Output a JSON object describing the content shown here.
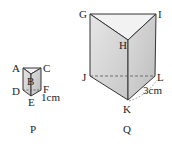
{
  "figure": {
    "prisms": [
      {
        "name": "P",
        "caption": "P",
        "vertices": {
          "A": "A",
          "B": "B",
          "C": "C",
          "D": "D",
          "E": "E",
          "F": "F"
        },
        "dimension_label": "1cm",
        "dimension_edge": "EF"
      },
      {
        "name": "Q",
        "caption": "Q",
        "vertices": {
          "G": "G",
          "H": "H",
          "I": "I",
          "J": "J",
          "K": "K",
          "L": "L"
        },
        "dimension_label": "3cm",
        "dimension_edge": "KL"
      }
    ],
    "colors": {
      "face_fill": "#d9d9d9",
      "face_light": "#ececec",
      "edge": "#333333",
      "hidden_edge": "#555555"
    }
  }
}
